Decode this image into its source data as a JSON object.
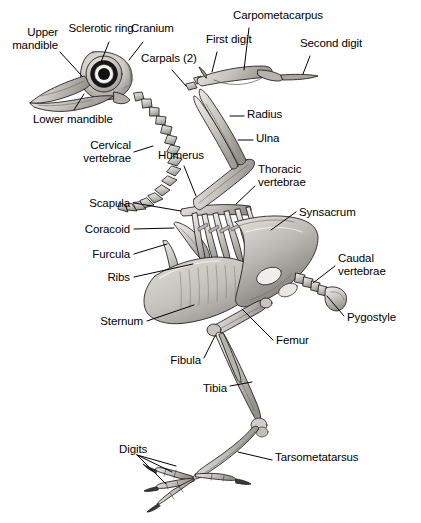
{
  "figure": {
    "title": "Bird skeleton labeled anatomical diagram",
    "width": 421,
    "height": 523,
    "background_color": "#ffffff",
    "line_color": "#000000",
    "bone_fill": "#c9c7c2",
    "bone_shade": "#8d8b86",
    "bone_light": "#e6e4df"
  },
  "labels": [
    {
      "id": "sclerotic-ring",
      "text": "Sclerotic ring",
      "lines": [
        "Sclerotic ring"
      ],
      "x": 101,
      "y": 28,
      "align": "c"
    },
    {
      "id": "cranium",
      "text": "Cranium",
      "lines": [
        "Cranium"
      ],
      "x": 131,
      "y": 28,
      "align": "l"
    },
    {
      "id": "upper-mandible",
      "text": "Upper mandible",
      "lines": [
        "Upper",
        "mandible"
      ],
      "x": 58,
      "y": 32,
      "align": "r"
    },
    {
      "id": "lower-mandible",
      "text": "Lower mandible",
      "lines": [
        "Lower mandible"
      ],
      "x": 33,
      "y": 113,
      "align": "l"
    },
    {
      "id": "carpals",
      "text": "Carpals (2)",
      "lines": [
        "Carpals (2)"
      ],
      "x": 141,
      "y": 58,
      "align": "l"
    },
    {
      "id": "carpometacarpus",
      "text": "Carpometacarpus",
      "lines": [
        "Carpometacarpus"
      ],
      "x": 233,
      "y": 14,
      "align": "l"
    },
    {
      "id": "first-digit",
      "text": "First digit",
      "lines": [
        "First digit"
      ],
      "x": 206,
      "y": 38,
      "align": "l"
    },
    {
      "id": "second-digit",
      "text": "Second digit",
      "lines": [
        "Second digit"
      ],
      "x": 300,
      "y": 42,
      "align": "l"
    },
    {
      "id": "radius",
      "text": "Radius",
      "lines": [
        "Radius"
      ],
      "x": 247,
      "y": 112,
      "align": "l"
    },
    {
      "id": "ulna",
      "text": "Ulna",
      "lines": [
        "Ulna"
      ],
      "x": 256,
      "y": 136,
      "align": "l"
    },
    {
      "id": "cervical-vertebrae",
      "text": "Cervical vertebrae",
      "lines": [
        "Cervical",
        "vertebrae"
      ],
      "x": 131,
      "y": 145,
      "align": "r"
    },
    {
      "id": "humerus",
      "text": "Humerus",
      "lines": [
        "Humerus"
      ],
      "x": 158,
      "y": 154,
      "align": "l"
    },
    {
      "id": "thoracic-vertebrae",
      "text": "Thoracic vertebrae",
      "lines": [
        "Thoracic",
        "vertebrae"
      ],
      "x": 258,
      "y": 169,
      "align": "l"
    },
    {
      "id": "scapula",
      "text": "Scapula",
      "lines": [
        "Scapula"
      ],
      "x": 130,
      "y": 199,
      "align": "r"
    },
    {
      "id": "coracoid",
      "text": "Coracoid",
      "lines": [
        "Coracoid"
      ],
      "x": 130,
      "y": 225,
      "align": "r"
    },
    {
      "id": "furcula",
      "text": "Furcula",
      "lines": [
        "Furcula"
      ],
      "x": 130,
      "y": 250,
      "align": "r"
    },
    {
      "id": "ribs",
      "text": "Ribs",
      "lines": [
        "Ribs"
      ],
      "x": 130,
      "y": 273,
      "align": "r"
    },
    {
      "id": "synsacrum",
      "text": "Synsacrum",
      "lines": [
        "Synsacrum"
      ],
      "x": 299,
      "y": 208,
      "align": "l"
    },
    {
      "id": "caudal-vertebrae",
      "text": "Caudal vertebrae",
      "lines": [
        "Caudal",
        "vertebrae"
      ],
      "x": 338,
      "y": 257,
      "align": "l"
    },
    {
      "id": "pygostyle",
      "text": "Pygostyle",
      "lines": [
        "Pygostyle"
      ],
      "x": 347,
      "y": 317,
      "align": "l"
    },
    {
      "id": "sternum",
      "text": "Sternum",
      "lines": [
        "Sternum"
      ],
      "x": 143,
      "y": 317,
      "align": "r"
    },
    {
      "id": "femur",
      "text": "Femur",
      "lines": [
        "Femur"
      ],
      "x": 276,
      "y": 336,
      "align": "l"
    },
    {
      "id": "fibula",
      "text": "Fibula",
      "lines": [
        "Fibula"
      ],
      "x": 201,
      "y": 361,
      "align": "r"
    },
    {
      "id": "tibia",
      "text": "Tibia",
      "lines": [
        "Tibia"
      ],
      "x": 227,
      "y": 389,
      "align": "r"
    },
    {
      "id": "digits",
      "text": "Digits",
      "lines": [
        "Digits"
      ],
      "x": 119,
      "y": 449,
      "align": "l"
    },
    {
      "id": "tarsometatarsus",
      "text": "Tarsometatarsus",
      "lines": [
        "Tarsometatarsus"
      ],
      "x": 275,
      "y": 456,
      "align": "l"
    }
  ],
  "leaders": [
    {
      "id": "leader-sclerotic-ring",
      "points": "109,42 101,62"
    },
    {
      "id": "leader-cranium",
      "points": "143,42 129,60"
    },
    {
      "id": "leader-upper-mandible",
      "points": "60,52 82,76"
    },
    {
      "id": "leader-lower-mandible",
      "points": "74,110 84,94"
    },
    {
      "id": "leader-carpals",
      "points": "172,70 186,86"
    },
    {
      "id": "leader-carpometacarpus",
      "points": "249,28 244,70"
    },
    {
      "id": "leader-first-digit",
      "points": "217,52 212,72"
    },
    {
      "id": "leader-second-digit",
      "points": "310,56 303,74"
    },
    {
      "id": "leader-radius",
      "points": "244,116 230,116"
    },
    {
      "id": "leader-ulna",
      "points": "253,140 238,140"
    },
    {
      "id": "leader-cervical-vertebrae",
      "points": "134,152 153,146"
    },
    {
      "id": "leader-humerus",
      "points": "184,166 196,196"
    },
    {
      "id": "leader-thoracic-vertebrae",
      "points": "255,186 236,204"
    },
    {
      "id": "leader-scapula",
      "points": "134,203 181,211"
    },
    {
      "id": "leader-coracoid",
      "points": "134,229 174,228"
    },
    {
      "id": "leader-furcula",
      "points": "134,254 167,244"
    },
    {
      "id": "leader-ribs",
      "points": "134,277 193,264"
    },
    {
      "id": "leader-synsacrum",
      "points": "296,212 271,230"
    },
    {
      "id": "leader-caudal-vertebrae",
      "points": "335,266 313,283"
    },
    {
      "id": "leader-pygostyle",
      "points": "344,316 327,296"
    },
    {
      "id": "leader-sternum",
      "points": "147,321 194,305"
    },
    {
      "id": "leader-femur",
      "points": "273,340 242,309"
    },
    {
      "id": "leader-fibula",
      "points": "204,358 215,336"
    },
    {
      "id": "leader-tibia",
      "points": "230,386 252,382"
    },
    {
      "id": "leader-digits-a",
      "points": "137,458 172,474"
    },
    {
      "id": "leader-digits-b",
      "points": "137,458 175,466"
    },
    {
      "id": "leader-digits-c",
      "points": "137,458 168,484"
    },
    {
      "id": "leader-tarsometatarsus",
      "points": "272,460 238,452"
    }
  ]
}
